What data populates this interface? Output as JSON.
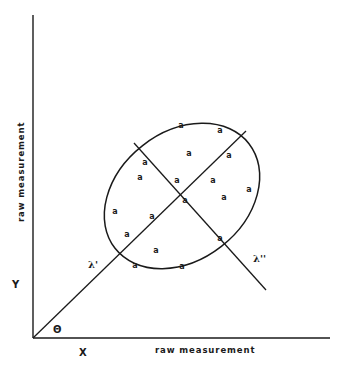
{
  "diagram": {
    "type": "principal-axes-scatter",
    "stroke_color": "#1a1a1a",
    "background": "#ffffff",
    "axes": {
      "origin": [
        33,
        338
      ],
      "y_axis_top": [
        33,
        15
      ],
      "x_axis_right": [
        330,
        338
      ],
      "x_title": "raw measurement",
      "y_title": "raw measurement",
      "x_var": "X",
      "y_var": "Y",
      "angle_label": "Θ"
    },
    "ellipse": {
      "cx": 182,
      "cy": 196,
      "rx": 85,
      "ry": 64,
      "rotation_deg": -38
    },
    "lambda1": {
      "label": "λ'",
      "from": [
        33,
        338
      ],
      "to": [
        246,
        131
      ]
    },
    "lambda2": {
      "label": "λ''",
      "from": [
        134,
        143
      ],
      "to": [
        266,
        290
      ]
    },
    "point_glyph": "a",
    "points": [
      [
        181,
        125
      ],
      [
        220,
        130
      ],
      [
        189,
        153
      ],
      [
        229,
        155
      ],
      [
        145,
        162
      ],
      [
        140,
        177
      ],
      [
        177,
        180
      ],
      [
        213,
        180
      ],
      [
        249,
        189
      ],
      [
        224,
        197
      ],
      [
        185,
        200
      ],
      [
        115,
        211
      ],
      [
        152,
        216
      ],
      [
        127,
        234
      ],
      [
        220,
        238
      ],
      [
        156,
        250
      ],
      [
        135,
        265
      ],
      [
        182,
        266
      ]
    ]
  }
}
